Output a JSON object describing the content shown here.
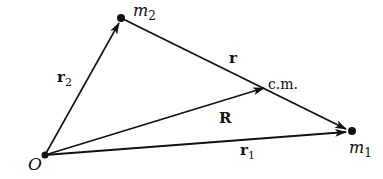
{
  "diagram": {
    "title": "",
    "points": {
      "origin": {
        "label": "O",
        "x": 45,
        "y": 155
      },
      "m2": {
        "label": "m",
        "sub": "2",
        "x": 121,
        "y": 18
      },
      "m1": {
        "label": "m",
        "sub": "1",
        "x": 352,
        "y": 131
      },
      "cm": {
        "label": "c.m.",
        "x": 266,
        "y": 87
      }
    },
    "vectors": [
      {
        "name": "r2",
        "label": "r",
        "sub": "2",
        "from": "origin",
        "to": "m2"
      },
      {
        "name": "R",
        "label": "R",
        "from": "origin",
        "to": "cm"
      },
      {
        "name": "r1",
        "label": "r",
        "sub": "1",
        "from": "origin",
        "to": "m1"
      },
      {
        "name": "r",
        "label": "r",
        "from": "m2",
        "to": "m1"
      }
    ],
    "colors": {
      "stroke": "#111111",
      "background": "#ffffff"
    }
  }
}
